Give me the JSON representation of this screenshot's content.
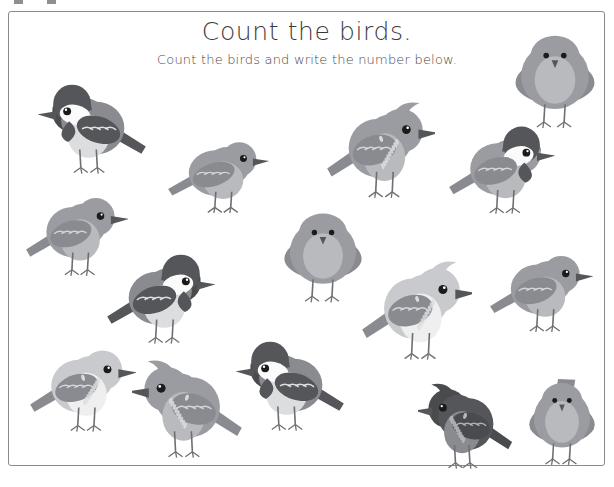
{
  "worksheet": {
    "title": "Count the birds.",
    "subtitle": "Count the birds and write the number below.",
    "frame": {
      "border_color": "#8a8a8a",
      "background": "#ffffff"
    }
  },
  "palette": {
    "dark": "#55565a",
    "darker": "#4a4b4f",
    "mid": "#8a8b90",
    "mid_light": "#9b9ca1",
    "light": "#b9babd",
    "lighter": "#c9cacd",
    "pale": "#dcdddf",
    "near_white": "#efeff0",
    "eye": "#1b1b1b",
    "outline": "#6e6f73"
  },
  "birds": [
    {
      "id": 1,
      "name": "chickadee-side-left",
      "species": "chickadee",
      "pose": "side",
      "facing": "left",
      "x": 38,
      "y": 82,
      "w": 110,
      "h": 92,
      "tone": "dark"
    },
    {
      "id": 2,
      "name": "robin-side-right-upper",
      "species": "robin",
      "pose": "side",
      "facing": "right",
      "x": 166,
      "y": 133,
      "w": 106,
      "h": 80,
      "tone": "mid"
    },
    {
      "id": 3,
      "name": "cardinal-crested-right",
      "species": "cardinal",
      "pose": "side",
      "facing": "right",
      "x": 325,
      "y": 97,
      "w": 110,
      "h": 102,
      "tone": "mid"
    },
    {
      "id": 4,
      "name": "chickadee-side-right-upper",
      "species": "chickadee",
      "pose": "side",
      "facing": "right",
      "x": 447,
      "y": 124,
      "w": 108,
      "h": 90,
      "tone": "mid"
    },
    {
      "id": 5,
      "name": "bird-front-top-right",
      "species": "robin",
      "pose": "front",
      "facing": "front",
      "x": 508,
      "y": 30,
      "w": 94,
      "h": 100,
      "tone": "mid"
    },
    {
      "id": 6,
      "name": "robin-side-right-left",
      "species": "robin",
      "pose": "side",
      "facing": "right",
      "x": 24,
      "y": 188,
      "w": 104,
      "h": 88,
      "tone": "mid"
    },
    {
      "id": 7,
      "name": "chickadee-side-right-mid",
      "species": "chickadee",
      "pose": "side",
      "facing": "right",
      "x": 105,
      "y": 252,
      "w": 110,
      "h": 92,
      "tone": "dark"
    },
    {
      "id": 8,
      "name": "bird-front-center",
      "species": "robin",
      "pose": "front",
      "facing": "front",
      "x": 277,
      "y": 208,
      "w": 92,
      "h": 96,
      "tone": "mid"
    },
    {
      "id": 9,
      "name": "crested-light-right",
      "species": "cardinal",
      "pose": "side",
      "facing": "right",
      "x": 360,
      "y": 256,
      "w": 112,
      "h": 105,
      "tone": "light"
    },
    {
      "id": 10,
      "name": "robin-side-right-far",
      "species": "robin",
      "pose": "side",
      "facing": "right",
      "x": 488,
      "y": 246,
      "w": 106,
      "h": 86,
      "tone": "mid"
    },
    {
      "id": 11,
      "name": "speckled-side-right-bottom",
      "species": "robin",
      "pose": "side",
      "facing": "right",
      "x": 28,
      "y": 340,
      "w": 108,
      "h": 92,
      "tone": "light"
    },
    {
      "id": 12,
      "name": "cardinal-crested-left",
      "species": "cardinal",
      "pose": "side",
      "facing": "left",
      "x": 132,
      "y": 355,
      "w": 112,
      "h": 104,
      "tone": "mid"
    },
    {
      "id": 13,
      "name": "chickadee-side-left-bottom",
      "species": "chickadee",
      "pose": "side",
      "facing": "left",
      "x": 236,
      "y": 339,
      "w": 110,
      "h": 92,
      "tone": "dark"
    },
    {
      "id": 14,
      "name": "cardinal-dark-left",
      "species": "cardinal",
      "pose": "side",
      "facing": "left",
      "x": 418,
      "y": 379,
      "w": 96,
      "h": 90,
      "tone": "darker"
    },
    {
      "id": 15,
      "name": "bird-front-bottom-right",
      "species": "robin",
      "pose": "front",
      "facing": "front",
      "x": 523,
      "y": 378,
      "w": 78,
      "h": 88,
      "tone": "mid"
    },
    {
      "id": 16,
      "name": "robin-side-left-mid",
      "species": "robin",
      "pose": "side",
      "facing": "left",
      "x": 0,
      "y": 0,
      "w": 0,
      "h": 0,
      "tone": "mid"
    }
  ],
  "crop_marks": [
    {
      "x": 14
    },
    {
      "x": 47
    }
  ]
}
